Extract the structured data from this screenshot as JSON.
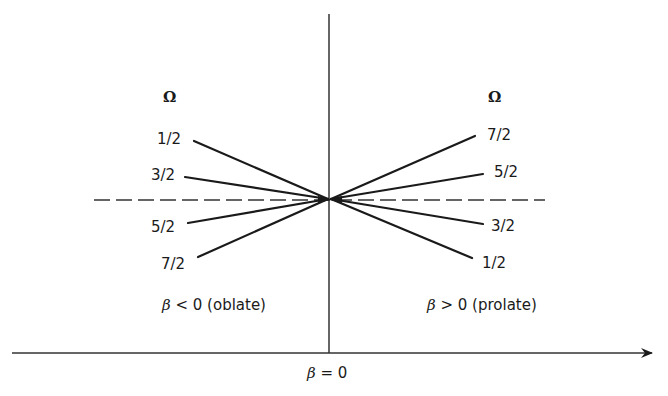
{
  "diagram": {
    "left_header": "Ω",
    "right_header": "Ω",
    "left_labels": [
      "1/2",
      "3/2",
      "5/2",
      "7/2"
    ],
    "right_labels": [
      "7/2",
      "5/2",
      "3/2",
      "1/2"
    ],
    "left_region": {
      "symbol": "β",
      "text": "< 0 (oblate)"
    },
    "right_region": {
      "symbol": "β",
      "text": "> 0 (prolate)"
    },
    "axis_label": {
      "symbol": "β",
      "text": "= 0"
    },
    "line_color": "#1a1a1a"
  }
}
